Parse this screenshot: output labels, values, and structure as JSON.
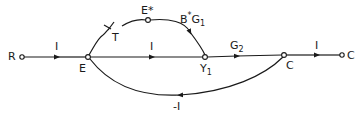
{
  "diagram": {
    "type": "signal-flow-graph",
    "nodes": {
      "R": "R",
      "E": "E",
      "E_star": "E*",
      "Y1": "Y",
      "Y1_sub": "1",
      "C_internal": "C",
      "C_output": "C"
    },
    "sampler": {
      "label": "T"
    },
    "branches": {
      "R_to_E": "I",
      "E_to_Y1_direct": "I",
      "Estar_to_Y1_base": "B",
      "Estar_to_Y1_star": "*",
      "Estar_to_Y1_G": "G",
      "Estar_to_Y1_sub": "1",
      "Y1_to_C_G": "G",
      "Y1_to_C_sub": "2",
      "C_to_output": "I",
      "feedback": "-I"
    },
    "edges": [
      {
        "from": "R",
        "to": "E",
        "gain": "I"
      },
      {
        "from": "E",
        "to": "E*",
        "gain": "sampler T"
      },
      {
        "from": "E*",
        "to": "Y1",
        "gain": "B*G1"
      },
      {
        "from": "E",
        "to": "Y1",
        "gain": "I"
      },
      {
        "from": "Y1",
        "to": "C",
        "gain": "G2"
      },
      {
        "from": "C",
        "to": "C_out",
        "gain": "I"
      },
      {
        "from": "C",
        "to": "E",
        "gain": "-I"
      }
    ],
    "colors": {
      "stroke": "#1a1a1a",
      "background": "#ffffff"
    }
  }
}
